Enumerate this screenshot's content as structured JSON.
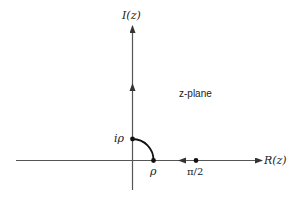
{
  "diagram": {
    "title": "z-plane",
    "axes": {
      "horizontal_label": "R(z)",
      "vertical_label": "I(z)"
    },
    "points": [
      {
        "id": "i_rho",
        "label": "iρ"
      },
      {
        "id": "rho",
        "label": "ρ"
      },
      {
        "id": "pi_half",
        "label": "π/2"
      }
    ],
    "colors": {
      "line": "#333333",
      "point": "#111111",
      "background": "#ffffff"
    }
  }
}
